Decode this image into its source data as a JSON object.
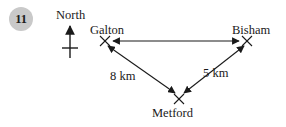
{
  "question": {
    "number": "11"
  },
  "diagram": {
    "type": "bearing-triangle-sketch",
    "compass": {
      "label": "North",
      "icon": "north-arrow-icon"
    },
    "places": [
      {
        "id": "galton",
        "label": "Galton",
        "marker": "cross-marker",
        "x": 105,
        "y": 41
      },
      {
        "id": "bisham",
        "label": "Bisham",
        "marker": "cross-marker",
        "x": 247,
        "y": 41
      },
      {
        "id": "metford",
        "label": "Metford",
        "marker": "cross-marker",
        "x": 179,
        "y": 99
      }
    ],
    "edges": [
      {
        "id": "galton-bisham",
        "from": "galton",
        "to": "bisham",
        "label": "",
        "arrows": "both"
      },
      {
        "id": "galton-metford",
        "from": "galton",
        "to": "metford",
        "label": "8 km",
        "arrows": "both"
      },
      {
        "id": "bisham-metford",
        "from": "bisham",
        "to": "metford",
        "label": "5 km",
        "arrows": "both"
      }
    ],
    "distance_labels": {
      "left": "8 km",
      "right": "5 km"
    },
    "colors": {
      "ink": "#1a1a1a",
      "badge_fill": "#c9c9c9",
      "background": "#ffffff"
    }
  }
}
